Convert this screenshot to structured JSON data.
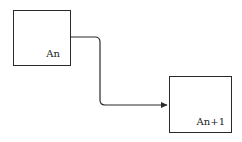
{
  "diagram": {
    "nodes": [
      {
        "id": "node-a",
        "label": "An"
      },
      {
        "id": "node-b",
        "label": "An+1"
      }
    ],
    "edges": [
      {
        "from": "An",
        "to": "An+1",
        "style": "elbow-arrow"
      }
    ],
    "colors": {
      "stroke": "#2a2a2a",
      "background": "#ffffff"
    }
  }
}
